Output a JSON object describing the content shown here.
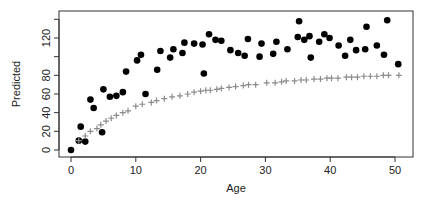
{
  "chart_data": {
    "type": "scatter",
    "title": "",
    "xlabel": "Age",
    "ylabel": "Predicted",
    "xlim": [
      -2.0,
      52.5
    ],
    "ylim": [
      -4,
      145
    ],
    "x_ticks": [
      0,
      10,
      20,
      30,
      40,
      50
    ],
    "y_ticks": [
      0,
      20,
      40,
      60,
      80,
      100,
      120,
      140
    ],
    "y_tick_labels": [
      "0",
      "20",
      "40",
      "60",
      "80",
      "",
      "120",
      ""
    ],
    "grid": false,
    "legend": null,
    "series": [
      {
        "name": "observed",
        "marker": "filled-circle",
        "color": "#000000",
        "points": [
          [
            0,
            0
          ],
          [
            1.2,
            10
          ],
          [
            1.5,
            25
          ],
          [
            2.2,
            9
          ],
          [
            3,
            54
          ],
          [
            3.5,
            45
          ],
          [
            4.8,
            19
          ],
          [
            5,
            65
          ],
          [
            6,
            57
          ],
          [
            7,
            58
          ],
          [
            8,
            62
          ],
          [
            8.5,
            84
          ],
          [
            10.2,
            96
          ],
          [
            10.8,
            102
          ],
          [
            11.5,
            60
          ],
          [
            13.3,
            86
          ],
          [
            13.8,
            106
          ],
          [
            15.3,
            99
          ],
          [
            15.8,
            108
          ],
          [
            17.2,
            104
          ],
          [
            17.5,
            115
          ],
          [
            19,
            114
          ],
          [
            20.3,
            113
          ],
          [
            20.5,
            82
          ],
          [
            21.3,
            124
          ],
          [
            22.3,
            118
          ],
          [
            23.2,
            117
          ],
          [
            24.6,
            107
          ],
          [
            25.8,
            104
          ],
          [
            26.8,
            101
          ],
          [
            27.3,
            119
          ],
          [
            29.1,
            100
          ],
          [
            29.4,
            114
          ],
          [
            31.2,
            103
          ],
          [
            31.7,
            116
          ],
          [
            33.4,
            108
          ],
          [
            35.0,
            121
          ],
          [
            35.2,
            138
          ],
          [
            36.0,
            118
          ],
          [
            36.8,
            122
          ],
          [
            37.0,
            99
          ],
          [
            38.3,
            116
          ],
          [
            39.1,
            124
          ],
          [
            39.9,
            120
          ],
          [
            41.3,
            112
          ],
          [
            42.3,
            101
          ],
          [
            43.1,
            118
          ],
          [
            44.0,
            107
          ],
          [
            45.4,
            108
          ],
          [
            45.6,
            132
          ],
          [
            47.2,
            112
          ],
          [
            48.3,
            102
          ],
          [
            48.8,
            139
          ],
          [
            50.5,
            92
          ]
        ]
      },
      {
        "name": "predicted",
        "marker": "plus",
        "color": "#8c8c8c",
        "points": [
          [
            1.2,
            10
          ],
          [
            2.2,
            15
          ],
          [
            3.0,
            20
          ],
          [
            4.0,
            23
          ],
          [
            4.6,
            27
          ],
          [
            5.4,
            31
          ],
          [
            6.2,
            34
          ],
          [
            7.0,
            37
          ],
          [
            8.0,
            40
          ],
          [
            8.8,
            42
          ],
          [
            10.0,
            47
          ],
          [
            11.0,
            49
          ],
          [
            12.4,
            51
          ],
          [
            13.2,
            53
          ],
          [
            14.4,
            55
          ],
          [
            15.6,
            57
          ],
          [
            16.8,
            58
          ],
          [
            18.0,
            60
          ],
          [
            19.0,
            62
          ],
          [
            20.0,
            63
          ],
          [
            20.8,
            64
          ],
          [
            21.5,
            64
          ],
          [
            22.5,
            65
          ],
          [
            23.2,
            66
          ],
          [
            24.4,
            67
          ],
          [
            25.4,
            68
          ],
          [
            26.6,
            69
          ],
          [
            27.4,
            70
          ],
          [
            28.5,
            70
          ],
          [
            30.2,
            72
          ],
          [
            31.5,
            72
          ],
          [
            32.5,
            73
          ],
          [
            33.2,
            74
          ],
          [
            34.5,
            74
          ],
          [
            35.5,
            75
          ],
          [
            36.3,
            75
          ],
          [
            37.5,
            76
          ],
          [
            38.5,
            76
          ],
          [
            39.5,
            77
          ],
          [
            40.2,
            77
          ],
          [
            41.2,
            77
          ],
          [
            42.5,
            78
          ],
          [
            43.3,
            78
          ],
          [
            44.2,
            78
          ],
          [
            45.2,
            79
          ],
          [
            46.2,
            79
          ],
          [
            47.2,
            79
          ],
          [
            48.2,
            80
          ],
          [
            49.0,
            80
          ],
          [
            50.6,
            80
          ]
        ]
      }
    ]
  }
}
